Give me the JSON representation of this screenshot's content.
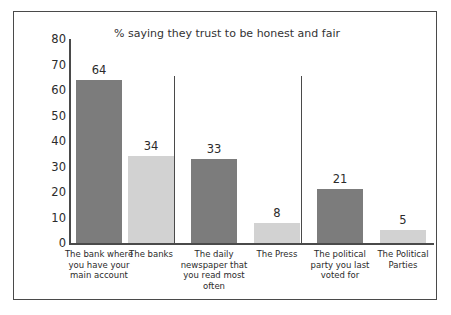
{
  "chart_data": {
    "type": "bar",
    "title": "% saying they trust to be honest and fair",
    "xlabel": "",
    "ylabel": "",
    "ylim": [
      0,
      80
    ],
    "yticks": [
      0,
      10,
      20,
      30,
      40,
      50,
      60,
      70,
      80
    ],
    "grid": false,
    "legend": "none",
    "categories": [
      "The bank where you have your main account",
      "The banks",
      "The daily newspaper that you read most often",
      "The Press",
      "The political party you last voted for",
      "The Political Parties"
    ],
    "values": [
      64,
      34,
      33,
      8,
      21,
      5
    ],
    "bar_colors": [
      "#7c7c7c",
      "#d2d2d2",
      "#7c7c7c",
      "#d2d2d2",
      "#7c7c7c",
      "#d2d2d2"
    ],
    "group_dividers": 2,
    "annotations": [
      "64",
      "34",
      "33",
      "8",
      "21",
      "5"
    ]
  },
  "colors": {
    "dark_bar": "#7c7c7c",
    "light_bar": "#d2d2d2",
    "axis": "#4a4a4a",
    "border": "#4a4a4a",
    "text": "#2b2b2b",
    "background": "#ffffff"
  },
  "ticks": {
    "t0": "0",
    "t1": "10",
    "t2": "20",
    "t3": "30",
    "t4": "40",
    "t5": "50",
    "t6": "60",
    "t7": "70",
    "t8": "80"
  },
  "bars": [
    {
      "value_label": "64",
      "category": "The bank where you have your main account"
    },
    {
      "value_label": "34",
      "category": "The banks"
    },
    {
      "value_label": "33",
      "category": "The daily newspaper that you read most often"
    },
    {
      "value_label": "8",
      "category": "The Press"
    },
    {
      "value_label": "21",
      "category": "The political party you last voted for"
    },
    {
      "value_label": "5",
      "category": "The Political Parties"
    }
  ]
}
